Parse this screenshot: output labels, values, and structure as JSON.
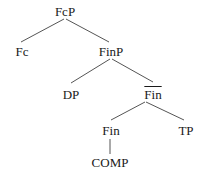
{
  "diagram": {
    "type": "syntax-tree",
    "nodes": {
      "fcp": {
        "label": "FcP",
        "x": 65,
        "y": 6
      },
      "fc": {
        "label": "Fc",
        "x": 22,
        "y": 45
      },
      "finp": {
        "label": "FinP",
        "x": 111,
        "y": 45
      },
      "dp": {
        "label": "DP",
        "x": 71,
        "y": 88
      },
      "finbar": {
        "label": "Fin",
        "x": 153,
        "y": 88,
        "overline": true
      },
      "fin": {
        "label": "Fin",
        "x": 111,
        "y": 124
      },
      "tp": {
        "label": "TP",
        "x": 186,
        "y": 124
      },
      "comp": {
        "label": "COMP",
        "x": 110,
        "y": 156
      }
    },
    "edges": [
      {
        "from": "fcp",
        "to": "fc"
      },
      {
        "from": "fcp",
        "to": "finp"
      },
      {
        "from": "finp",
        "to": "dp"
      },
      {
        "from": "finp",
        "to": "finbar"
      },
      {
        "from": "finbar",
        "to": "fin"
      },
      {
        "from": "finbar",
        "to": "tp"
      },
      {
        "from": "fin",
        "to": "comp"
      }
    ]
  }
}
